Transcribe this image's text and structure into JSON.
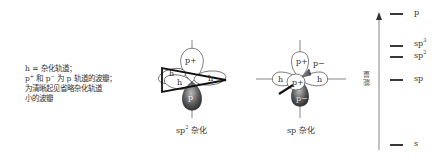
{
  "legend": {
    "line1": "h = 杂化轨道；",
    "line2_p_plus": "p",
    "line2_mid": " 和 p",
    "line2_rest": " 为 p 轨道的波瓣；",
    "line3": "为清晰起见省略杂化轨道",
    "line4": "小的波瓣",
    "sup_plus": "+",
    "sup_minus": "−"
  },
  "sp2_diagram": {
    "caption_prefix": "sp",
    "caption_sup": "2",
    "caption_suffix": " 杂化",
    "labels": {
      "p_plus": "p+",
      "p_minus": "p",
      "h": "h"
    }
  },
  "sp_diagram": {
    "caption": "sp 杂化",
    "labels": {
      "p_plus": "p+",
      "p_minus": "p−",
      "h": "h"
    }
  },
  "energy_diagram": {
    "axis_label": "能量",
    "levels": [
      {
        "name": "p",
        "y": 16
      },
      {
        "name": "sp",
        "sup": "3",
        "y": 46
      },
      {
        "name": "sp",
        "sup": "2",
        "y": 57
      },
      {
        "name": "sp",
        "y": 80
      },
      {
        "name": "s",
        "y": 145
      }
    ]
  }
}
